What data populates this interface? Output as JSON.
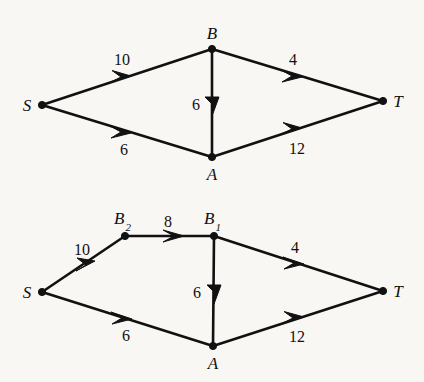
{
  "figure": {
    "background_color": "#f8f7f4",
    "ink_color": "#111111",
    "diagrams": [
      {
        "id": "top-network",
        "nodes": [
          {
            "name": "S",
            "label": "S",
            "sub": "",
            "x": 42,
            "y": 105,
            "label_x": 27,
            "label_y": 105
          },
          {
            "name": "B",
            "label": "B",
            "sub": "",
            "x": 212,
            "y": 49,
            "label_x": 212,
            "label_y": 33
          },
          {
            "name": "A",
            "label": "A",
            "sub": "",
            "x": 212,
            "y": 157,
            "label_x": 212,
            "label_y": 174
          },
          {
            "name": "T",
            "label": "T",
            "sub": "",
            "x": 383,
            "y": 101,
            "label_x": 398,
            "label_y": 101
          }
        ],
        "edges": [
          {
            "from": "S",
            "to": "B",
            "capacity": "10",
            "label_x": 122,
            "label_y": 60
          },
          {
            "from": "S",
            "to": "A",
            "capacity": "6",
            "label_x": 124,
            "label_y": 150
          },
          {
            "from": "B",
            "to": "T",
            "capacity": "4",
            "label_x": 293,
            "label_y": 60
          },
          {
            "from": "A",
            "to": "T",
            "capacity": "12",
            "label_x": 297,
            "label_y": 149
          },
          {
            "from": "B",
            "to": "A",
            "capacity": "6",
            "label_x": 196,
            "label_y": 105
          }
        ]
      },
      {
        "id": "bottom-network",
        "nodes": [
          {
            "name": "S",
            "label": "S",
            "sub": "",
            "x": 42,
            "y": 292,
            "label_x": 27,
            "label_y": 292
          },
          {
            "name": "B2",
            "label": "B",
            "sub": "2",
            "x": 125,
            "y": 236,
            "label_x": 122,
            "label_y": 220
          },
          {
            "name": "B1",
            "label": "B",
            "sub": "1",
            "x": 214,
            "y": 236,
            "label_x": 212,
            "label_y": 220
          },
          {
            "name": "A",
            "label": "A",
            "sub": "",
            "x": 213,
            "y": 346,
            "label_x": 213,
            "label_y": 363
          },
          {
            "name": "T",
            "label": "T",
            "sub": "",
            "x": 383,
            "y": 291,
            "label_x": 398,
            "label_y": 291
          }
        ],
        "edges": [
          {
            "from": "S",
            "to": "B2",
            "capacity": "10",
            "label_x": 82,
            "label_y": 250
          },
          {
            "from": "B2",
            "to": "B1",
            "capacity": "8",
            "label_x": 168,
            "label_y": 222
          },
          {
            "from": "S",
            "to": "A",
            "capacity": "6",
            "label_x": 126,
            "label_y": 336
          },
          {
            "from": "B1",
            "to": "T",
            "capacity": "4",
            "label_x": 295,
            "label_y": 248
          },
          {
            "from": "A",
            "to": "T",
            "capacity": "12",
            "label_x": 297,
            "label_y": 337
          },
          {
            "from": "B1",
            "to": "A",
            "capacity": "6",
            "label_x": 197,
            "label_y": 293
          }
        ]
      }
    ]
  }
}
